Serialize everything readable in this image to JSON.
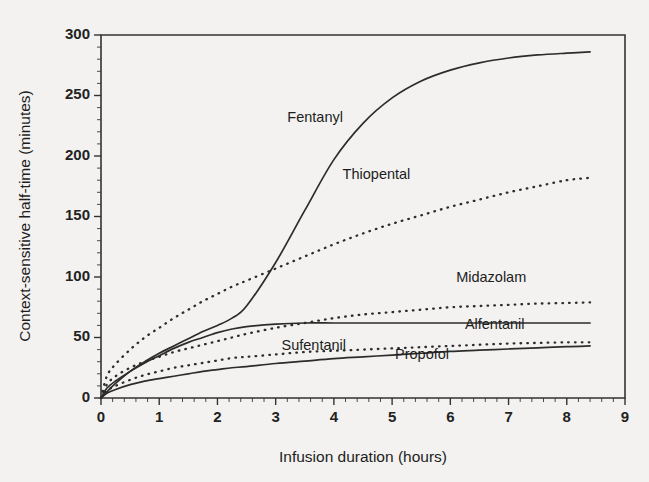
{
  "chart_data": {
    "type": "line",
    "title": "",
    "xlabel": "Infusion duration (hours)",
    "ylabel": "Context-sensitive half-time (minutes)",
    "xlim": [
      0,
      9
    ],
    "ylim": [
      0,
      300
    ],
    "xticks": [
      0,
      1,
      2,
      3,
      4,
      5,
      6,
      7,
      8,
      9
    ],
    "yticks": [
      0,
      50,
      100,
      150,
      200,
      250,
      300
    ],
    "xtick_labels": [
      "0",
      "1",
      "2",
      "3",
      "4",
      "5",
      "6",
      "7",
      "8",
      "9"
    ],
    "ytick_labels": [
      "0",
      "50",
      "100",
      "150",
      "200",
      "250",
      "300"
    ],
    "x_minor_step": 0.2,
    "y_minor_step": 10,
    "grid": false,
    "legend": "inline-labels",
    "x": [
      0,
      0.1,
      0.25,
      0.5,
      0.75,
      1,
      1.25,
      1.5,
      1.75,
      2,
      2.25,
      2.5,
      3,
      3.5,
      4,
      4.5,
      5,
      5.5,
      6,
      6.5,
      7,
      7.5,
      8,
      8.4
    ],
    "series": [
      {
        "name": "Fentanyl",
        "style": "solid",
        "label_x": 3.2,
        "label_y": 228,
        "values": [
          0,
          5,
          12,
          22,
          30,
          37,
          43,
          49,
          55,
          60,
          66,
          76,
          112,
          155,
          197,
          227,
          248,
          262,
          271,
          277,
          281,
          283.5,
          285,
          286
        ]
      },
      {
        "name": "Thiopental",
        "style": "dotted",
        "label_x": 4.15,
        "label_y": 181,
        "values": [
          0,
          18,
          28,
          40,
          50,
          58,
          66,
          73,
          80,
          86,
          92,
          97,
          107,
          117,
          127,
          136,
          144,
          151,
          158,
          164,
          170,
          175,
          180,
          182
        ]
      },
      {
        "name": "Midazolam",
        "style": "dotted",
        "label_x": 6.1,
        "label_y": 96,
        "values": [
          0,
          11,
          18,
          25,
          30,
          34,
          38,
          41,
          44,
          47,
          50,
          53,
          58,
          62,
          66,
          69,
          71,
          73,
          75,
          76,
          77,
          78,
          78.5,
          79
        ]
      },
      {
        "name": "Alfentanil",
        "style": "solid",
        "label_x": 6.25,
        "label_y": 57,
        "values": [
          0,
          8,
          14,
          22,
          29,
          35,
          41,
          46,
          50,
          54,
          57,
          59,
          61,
          62,
          62,
          62,
          62,
          62,
          62,
          62,
          62,
          62,
          62,
          62
        ]
      },
      {
        "name": "Sufentanil",
        "style": "dotted",
        "label_x": 3.1,
        "label_y": 40,
        "values": [
          0,
          6,
          10,
          15,
          19,
          22,
          25,
          27,
          29,
          31,
          33,
          34,
          36,
          38,
          39,
          40,
          41,
          42,
          43,
          44,
          45,
          45.5,
          46,
          46
        ]
      },
      {
        "name": "Propofol",
        "style": "solid",
        "label_x": 5.05,
        "label_y": 32,
        "values": [
          0,
          4,
          7,
          11,
          14,
          16,
          18,
          20,
          22,
          23.5,
          25,
          26,
          28.5,
          30.5,
          32.5,
          34,
          35.5,
          37,
          38.5,
          39.5,
          40.5,
          41.5,
          42.5,
          43
        ]
      }
    ]
  }
}
